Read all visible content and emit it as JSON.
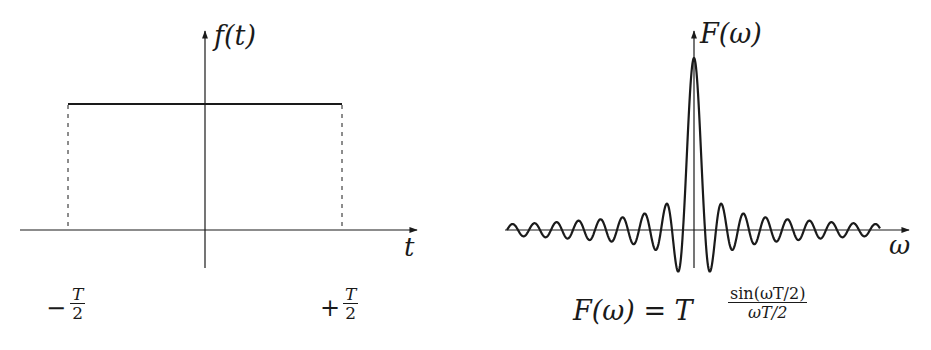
{
  "left_plot": {
    "y_label": "f(t)",
    "x_label": "t",
    "tick_left": {
      "sign": "−",
      "num": "T",
      "den": "2"
    },
    "tick_right": {
      "sign": "+",
      "num": "T",
      "den": "2"
    }
  },
  "right_plot": {
    "y_label": "F(ω)",
    "x_label": "ω",
    "formula": {
      "lhs": "F(ω) = T",
      "num": "sin(ωT/2)",
      "den": "ωT/2"
    }
  },
  "colors": {
    "stroke": "#1a1a1a",
    "background": "#ffffff"
  },
  "chart_data": [
    {
      "type": "line",
      "title": "Rectangular pulse",
      "xlabel": "t",
      "ylabel": "f(t)",
      "x_ticks": [
        "−T/2",
        "+T/2"
      ],
      "series": [
        {
          "name": "f(t)",
          "x": [
            -0.5,
            -0.5,
            0.5,
            0.5
          ],
          "y": [
            0,
            1,
            1,
            0
          ],
          "note": "f(t)=1 for |t|<T/2, 0 otherwise; verticals drawn dashed"
        }
      ],
      "grid": false
    },
    {
      "type": "line",
      "title": "Fourier transform (sinc)",
      "xlabel": "ω",
      "ylabel": "F(ω)",
      "annotation": "F(ω) = T sin(ωT/2) / (ωT/2)",
      "series": [
        {
          "name": "F(ω)",
          "function": "sinc",
          "peak": 1,
          "first_min": -0.217,
          "second_max": 0.128,
          "side_lobes_each_side": 13
        }
      ],
      "grid": false
    }
  ]
}
